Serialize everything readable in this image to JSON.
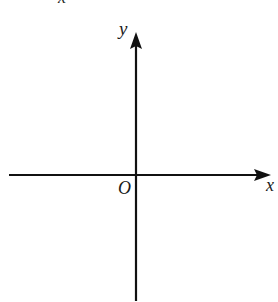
{
  "diagram": {
    "type": "cartesian-axes",
    "stroke_color": "#111111",
    "origin": {
      "x": 136,
      "y": 175
    },
    "x_axis": {
      "label": "x",
      "from": {
        "x": 9,
        "y": 175
      },
      "to": {
        "x": 271,
        "y": 175
      },
      "arrow": "right"
    },
    "y_axis": {
      "label": "y",
      "from": {
        "x": 136,
        "y": 301
      },
      "to": {
        "x": 136,
        "y": 32
      },
      "arrow": "up"
    },
    "origin_label": "O",
    "cropped_top_label": "x"
  }
}
